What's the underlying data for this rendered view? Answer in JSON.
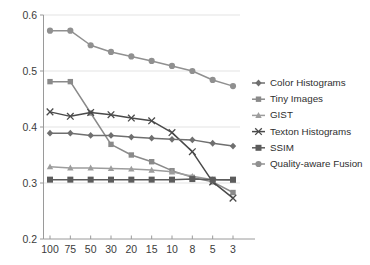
{
  "chart_data": {
    "type": "line",
    "title": "",
    "xlabel": "",
    "ylabel": "",
    "categories": [
      "100",
      "75",
      "50",
      "30",
      "20",
      "15",
      "10",
      "8",
      "5",
      "3"
    ],
    "ylim": [
      0.2,
      0.6
    ],
    "yticks": [
      "0.6",
      "0.5",
      "0.4",
      "0.3",
      "0.2"
    ],
    "ytick_values": [
      0.6,
      0.5,
      0.4,
      0.3,
      0.2
    ],
    "grid": true,
    "legend_position": "right",
    "series": [
      {
        "name": "Color Histograms",
        "color": "#6f6f6f",
        "marker": "diamond",
        "values": [
          0.389,
          0.389,
          0.385,
          0.385,
          0.382,
          0.38,
          0.378,
          0.377,
          0.371,
          0.366
        ]
      },
      {
        "name": "Tiny Images",
        "color": "#8a8a8a",
        "marker": "square",
        "values": [
          0.481,
          0.481,
          0.425,
          0.369,
          0.35,
          0.338,
          0.322,
          0.31,
          0.302,
          0.283
        ]
      },
      {
        "name": "GIST",
        "color": "#9d9d9d",
        "marker": "triangle",
        "values": [
          0.329,
          0.327,
          0.327,
          0.326,
          0.325,
          0.323,
          0.32,
          0.312,
          0.306,
          0.305
        ]
      },
      {
        "name": "Texton Histograms",
        "color": "#4a4a4a",
        "marker": "cross",
        "values": [
          0.427,
          0.419,
          0.426,
          0.422,
          0.416,
          0.411,
          0.39,
          0.356,
          0.302,
          0.273
        ]
      },
      {
        "name": "SSIM",
        "color": "#5c5c5c",
        "marker": "filled-square",
        "values": [
          0.306,
          0.306,
          0.306,
          0.306,
          0.306,
          0.306,
          0.306,
          0.307,
          0.306,
          0.306
        ]
      },
      {
        "name": "Quality-aware Fusion",
        "color": "#909090",
        "marker": "circle",
        "values": [
          0.572,
          0.572,
          0.546,
          0.534,
          0.526,
          0.518,
          0.509,
          0.5,
          0.484,
          0.473
        ]
      }
    ]
  },
  "legend": {
    "items": [
      {
        "label": "Color Histograms"
      },
      {
        "label": "Tiny Images"
      },
      {
        "label": "GIST"
      },
      {
        "label": "Texton Histograms"
      },
      {
        "label": "SSIM"
      },
      {
        "label": "Quality-aware Fusion"
      }
    ]
  }
}
